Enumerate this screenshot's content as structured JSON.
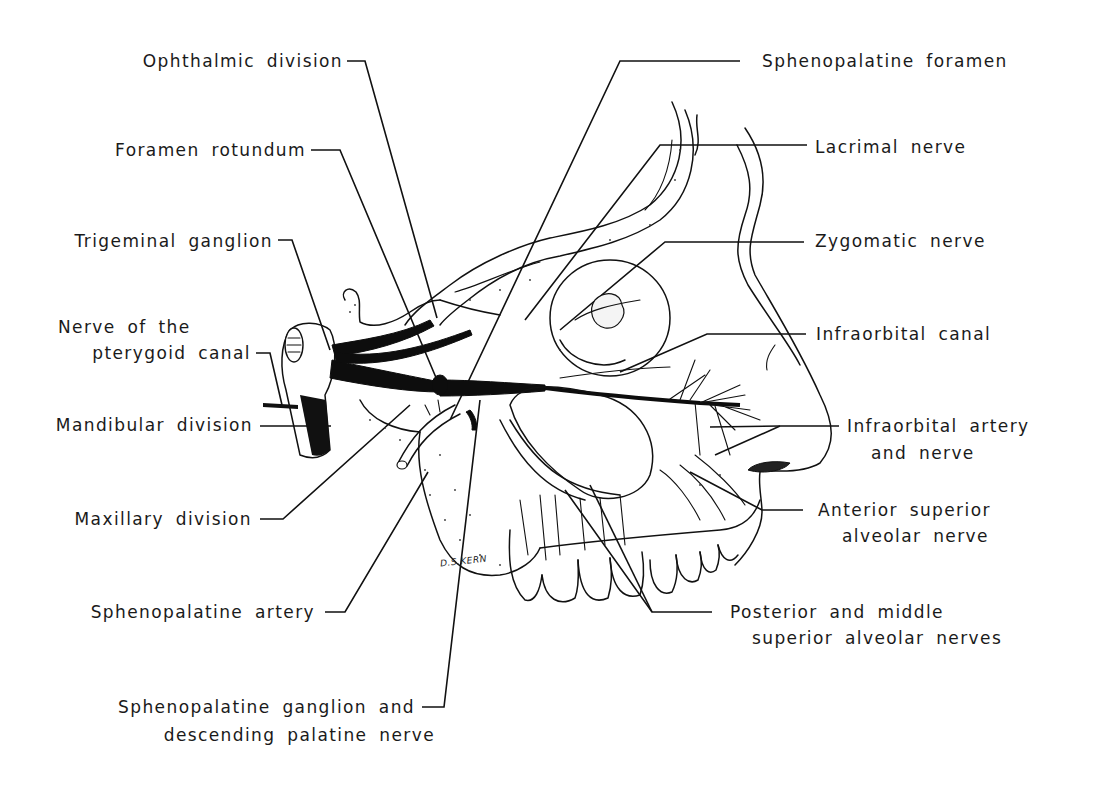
{
  "figure": {
    "type": "anatomical line drawing",
    "signature": "D.S.KERN"
  },
  "labels_left": [
    {
      "id": "ophthalmic-division",
      "text": "Ophthalmic division"
    },
    {
      "id": "foramen-rotundum",
      "text": "Foramen rotundum"
    },
    {
      "id": "trigeminal-ganglion",
      "text": "Trigeminal ganglion"
    },
    {
      "id": "nerve-pterygoid-canal",
      "line1": "Nerve of the",
      "line2": "pterygoid canal"
    },
    {
      "id": "mandibular-division",
      "text": "Mandibular division"
    },
    {
      "id": "maxillary-division",
      "text": "Maxillary division"
    },
    {
      "id": "sphenopalatine-artery",
      "text": "Sphenopalatine artery"
    },
    {
      "id": "sphenopalatine-ganglion",
      "line1": "Sphenopalatine ganglion and",
      "line2": "descending palatine nerve"
    }
  ],
  "labels_right": [
    {
      "id": "sphenopalatine-foramen",
      "text": "Sphenopalatine foramen"
    },
    {
      "id": "lacrimal-nerve",
      "text": "Lacrimal nerve"
    },
    {
      "id": "zygomatic-nerve",
      "text": "Zygomatic nerve"
    },
    {
      "id": "infraorbital-canal",
      "text": "Infraorbital canal"
    },
    {
      "id": "infraorbital-artery-nerve",
      "line1": "Infraorbital artery",
      "line2": "and nerve"
    },
    {
      "id": "anterior-superior-alveolar",
      "line1": "Anterior superior",
      "line2": "alveolar nerve"
    },
    {
      "id": "posterior-middle-alveolar",
      "line1": "Posterior and middle",
      "line2": "superior alveolar nerves"
    }
  ]
}
